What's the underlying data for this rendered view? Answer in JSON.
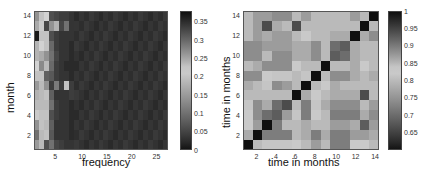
{
  "chart_data": [
    {
      "type": "heatmap",
      "title": "",
      "xlabel": "frequency",
      "ylabel": "month",
      "x_ticks": [
        5,
        10,
        15,
        20,
        25
      ],
      "y_ticks": [
        2,
        4,
        6,
        8,
        10,
        12,
        14
      ],
      "x_range": [
        1,
        27
      ],
      "y_range": [
        1,
        14
      ],
      "colorbar": {
        "ticks": [
          "0",
          "0.05",
          "0.1",
          "0.15",
          "0.2",
          "0.25",
          "0.3",
          "0.35"
        ],
        "range": [
          0,
          0.38
        ],
        "colormap": "gray dark-light-dark"
      },
      "grid": false,
      "rows_bottom_to_top": [
        [
          0.15,
          0.19,
          0.06,
          0.1,
          0.05,
          0.04,
          0.03,
          0.03
        ],
        [
          0.1,
          0.19,
          0.2,
          0.07,
          0.03,
          0.03,
          0.03,
          0.02
        ],
        [
          0.14,
          0.2,
          0.19,
          0.08,
          0.03,
          0.03,
          0.03,
          0.02
        ],
        [
          0.21,
          0.2,
          0.2,
          0.06,
          0.04,
          0.03,
          0.03,
          0.02
        ],
        [
          0.19,
          0.19,
          0.19,
          0.1,
          0.04,
          0.03,
          0.03,
          0.02
        ],
        [
          0.18,
          0.19,
          0.2,
          0.08,
          0.03,
          0.03,
          0.03,
          0.04
        ],
        [
          0.15,
          0.19,
          0.14,
          0.04,
          0.11,
          0.04,
          0.23,
          0.04
        ],
        [
          0.23,
          0.2,
          0.08,
          0.07,
          0.04,
          0.03,
          0.03,
          0.02
        ],
        [
          0.22,
          0.13,
          0.19,
          0.09,
          0.04,
          0.03,
          0.02,
          0.02
        ],
        [
          0.24,
          0.17,
          0.14,
          0.1,
          0.05,
          0.03,
          0.03,
          0.02
        ],
        [
          0.24,
          0.22,
          0.2,
          0.09,
          0.04,
          0.03,
          0.03,
          0.02
        ],
        [
          0.37,
          0.2,
          0.2,
          0.06,
          0.04,
          0.03,
          0.03,
          0.03
        ],
        [
          0.17,
          0.21,
          0.05,
          0.14,
          0.18,
          0.05,
          0.1,
          0.03
        ],
        [
          0.14,
          0.2,
          0.22,
          0.06,
          0.05,
          0.04,
          0.04,
          0.03
        ]
      ],
      "remaining_columns_value": 0.02,
      "n_cols": 27
    },
    {
      "type": "heatmap",
      "title": "",
      "xlabel": "time in months",
      "ylabel": "time in months",
      "x_ticks": [
        2,
        4,
        6,
        8,
        10,
        12,
        14
      ],
      "y_ticks": [
        2,
        4,
        6,
        8,
        10,
        12,
        14
      ],
      "x_range": [
        1,
        14
      ],
      "y_range": [
        1,
        14
      ],
      "colorbar": {
        "ticks": [
          "0.65",
          "0.7",
          "0.75",
          "0.8",
          "0.85",
          "0.9",
          "0.95",
          "1"
        ],
        "range": [
          0.6,
          1.0
        ],
        "colormap": "gray dark-light-dark"
      },
      "grid": false,
      "rows_bottom_to_top": [
        [
          1.0,
          0.8,
          0.84,
          0.84,
          0.84,
          0.82,
          0.8,
          0.76,
          0.8,
          0.72,
          0.72,
          0.82,
          0.82,
          0.8
        ],
        [
          0.78,
          1.0,
          0.72,
          0.72,
          0.72,
          0.8,
          0.78,
          0.72,
          0.78,
          0.72,
          0.72,
          0.76,
          0.76,
          0.78
        ],
        [
          0.82,
          0.76,
          1.0,
          0.72,
          0.8,
          0.8,
          0.78,
          0.8,
          0.8,
          0.76,
          0.76,
          0.78,
          0.68,
          0.76
        ],
        [
          0.82,
          0.74,
          0.7,
          0.68,
          0.76,
          0.84,
          0.72,
          0.82,
          0.8,
          0.72,
          0.72,
          0.72,
          0.78,
          0.74
        ],
        [
          0.84,
          0.74,
          0.78,
          0.7,
          0.66,
          0.8,
          0.72,
          0.84,
          0.78,
          0.74,
          0.74,
          0.74,
          0.8,
          0.76
        ],
        [
          0.8,
          0.8,
          0.8,
          0.8,
          0.8,
          1.0,
          0.78,
          0.82,
          0.8,
          0.78,
          0.78,
          0.78,
          0.66,
          0.8
        ],
        [
          0.78,
          0.8,
          0.84,
          0.74,
          0.76,
          0.8,
          1.0,
          0.8,
          0.82,
          0.78,
          0.8,
          0.8,
          0.8,
          0.8
        ],
        [
          0.74,
          0.74,
          0.82,
          0.84,
          0.84,
          0.8,
          0.84,
          1.0,
          0.8,
          0.74,
          0.74,
          0.78,
          0.8,
          0.78
        ],
        [
          0.8,
          0.78,
          0.74,
          0.74,
          0.74,
          0.82,
          0.8,
          0.8,
          1.0,
          0.8,
          0.8,
          0.78,
          0.82,
          0.8
        ],
        [
          0.74,
          0.74,
          0.8,
          0.74,
          0.74,
          0.86,
          0.78,
          0.74,
          0.8,
          0.68,
          0.7,
          0.78,
          0.8,
          0.8
        ],
        [
          0.74,
          0.74,
          0.76,
          0.76,
          0.76,
          0.78,
          0.78,
          0.74,
          0.8,
          0.7,
          0.68,
          0.78,
          0.8,
          0.8
        ],
        [
          0.8,
          0.76,
          0.78,
          0.76,
          0.76,
          0.8,
          0.82,
          0.8,
          0.8,
          0.78,
          0.78,
          1.0,
          0.78,
          0.74
        ],
        [
          0.8,
          0.76,
          0.66,
          0.78,
          0.8,
          0.66,
          0.8,
          0.8,
          0.8,
          0.8,
          0.8,
          0.8,
          1.0,
          0.8
        ],
        [
          0.8,
          0.76,
          0.76,
          0.74,
          0.74,
          0.8,
          0.76,
          0.8,
          0.8,
          0.8,
          0.8,
          0.76,
          0.8,
          1.0
        ]
      ]
    }
  ],
  "left": {
    "xlabel": "frequency",
    "ylabel": "month",
    "x_ticks": [
      "5",
      "10",
      "15",
      "20",
      "25"
    ],
    "y_ticks": [
      "2",
      "4",
      "6",
      "8",
      "10",
      "12",
      "14"
    ],
    "cbar_ticks": [
      "0",
      "0.05",
      "0.1",
      "0.15",
      "0.2",
      "0.25",
      "0.3",
      "0.35"
    ]
  },
  "right": {
    "xlabel": "time in months",
    "ylabel": "time in months",
    "x_ticks": [
      "2",
      "4",
      "6",
      "8",
      "10",
      "12",
      "14"
    ],
    "y_ticks": [
      "2",
      "4",
      "6",
      "8",
      "10",
      "12",
      "14"
    ],
    "cbar_ticks": [
      "0.65",
      "0.7",
      "0.75",
      "0.8",
      "0.85",
      "0.9",
      "0.95",
      "1"
    ]
  }
}
